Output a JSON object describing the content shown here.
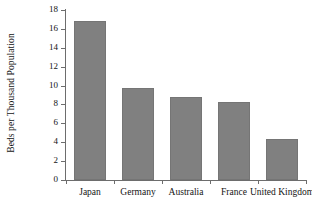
{
  "chart_data": {
    "type": "bar",
    "title": "",
    "xlabel": "",
    "ylabel": "Beds per Thousand Population",
    "categories": [
      "Japan",
      "Germany",
      "Australia",
      "France",
      "United Kingdom"
    ],
    "values": [
      16.8,
      9.7,
      8.8,
      8.3,
      4.3
    ],
    "ylim": [
      0,
      18
    ],
    "yticks": [
      0,
      2,
      4,
      6,
      8,
      10,
      12,
      14,
      16,
      18
    ],
    "ytick_labels": [
      "0",
      "2",
      "4",
      "6",
      "8",
      "10",
      "12",
      "14",
      "16",
      "18"
    ],
    "grid": false,
    "legend": false,
    "bar_color": "#808080",
    "axis_color": "#6d6d6d",
    "text_color": "#141414",
    "background": "#ffffff"
  }
}
